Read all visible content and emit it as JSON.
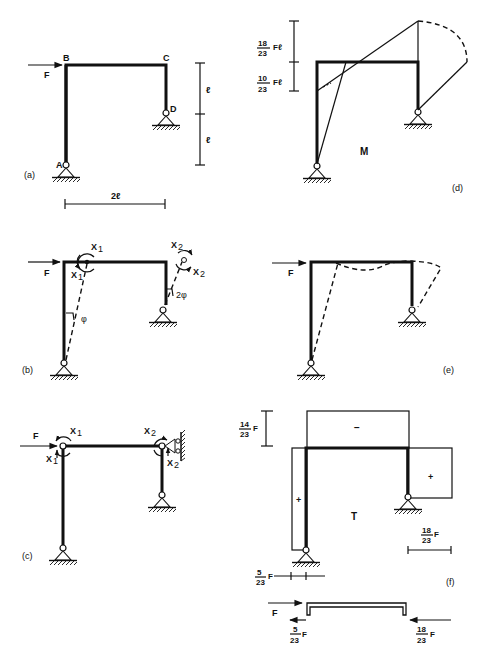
{
  "figure": {
    "panels": {
      "a": {
        "caption": "(a)",
        "nodes": {
          "A": "A",
          "B": "B",
          "C": "C",
          "D": "D"
        },
        "load": "F",
        "dim_height_upper": "ℓ",
        "dim_height_lower": "ℓ",
        "dim_width": "2ℓ"
      },
      "b": {
        "caption": "(b)",
        "load": "F",
        "moment_x1_top": "X",
        "moment_x1_left": "X",
        "moment_x2_top": "X",
        "moment_x2_right": "X",
        "sub1": "1",
        "sub2": "2",
        "angle_left": "φ",
        "angle_right": "2φ"
      },
      "c": {
        "caption": "(c)",
        "load": "F",
        "moment_x1_top": "X",
        "moment_x1_left": "X",
        "moment_x2_top": "X",
        "moment_x2_right": "X",
        "sub1": "1",
        "sub2": "2"
      },
      "d": {
        "caption": "(d)",
        "diagram_label": "M",
        "upper_value_num": "18",
        "upper_value_den": "23",
        "upper_value_unit": "Fℓ",
        "lower_value_num": "10",
        "lower_value_den": "23",
        "lower_value_unit": "Fℓ"
      },
      "e": {
        "caption": "(e)",
        "load": "F"
      },
      "f": {
        "caption": "(f)",
        "diagram_label": "T",
        "sign_beam": "−",
        "sign_left_column": "+",
        "sign_right_column": "+",
        "beam_value_num": "14",
        "beam_value_den": "23",
        "beam_value_unit": "F",
        "right_value_num": "18",
        "right_value_den": "23",
        "right_value_unit": "F",
        "left_value_num": "5",
        "left_value_den": "23",
        "left_value_unit": "F",
        "fbd_load": "F",
        "fbd_left_num": "5",
        "fbd_left_den": "23",
        "fbd_left_unit": "F",
        "fbd_right_num": "18",
        "fbd_right_den": "23",
        "fbd_right_unit": "F"
      }
    }
  }
}
